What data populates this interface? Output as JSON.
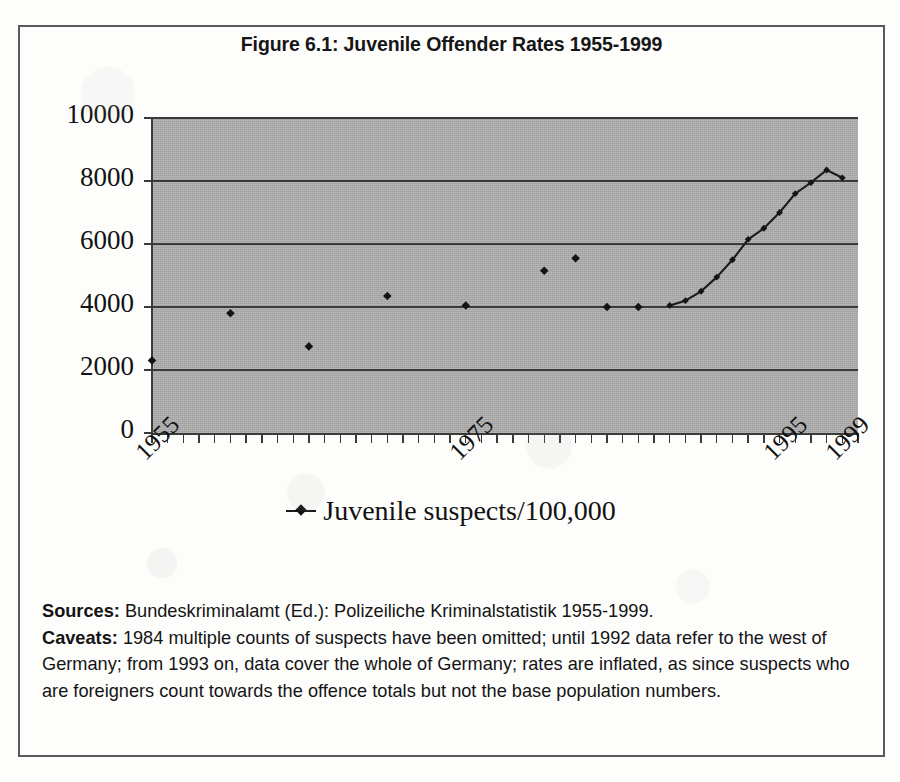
{
  "figure": {
    "title": "Figure 6.1: Juvenile Offender Rates 1955-1999",
    "legend_label": "Juvenile suspects/100,000",
    "legend_symbol": "line-with-diamond-marker",
    "sources_label": "Sources:",
    "sources_text": " Bundeskriminalamt (Ed.): Polizeiliche Kriminalstatistik 1955-1999.",
    "caveats_label": "Caveats:",
    "caveats_text": " 1984 multiple counts of suspects have been omitted; until 1992 data refer to the west of Germany; from 1993 on, data cover the whole of Germany; rates are inflated, as since suspects who are foreigners count towards the offence totals but not the base population numbers.",
    "colors": {
      "plot_background": "#a9a9a9",
      "gridline": "#3a3a3a",
      "series": "#1a1a1a",
      "frame": "#5a5a5a",
      "text": "#121212"
    }
  },
  "chart_data": {
    "type": "line",
    "title": "Figure 6.1: Juvenile Offender Rates 1955-1999",
    "xlabel": "",
    "ylabel": "",
    "ylim": [
      0,
      10000
    ],
    "xlim": [
      1955,
      2000
    ],
    "ytick_labels": [
      "10000",
      "8000",
      "6000",
      "4000",
      "2000",
      "0"
    ],
    "ytick_values": [
      10000,
      8000,
      6000,
      4000,
      2000,
      0
    ],
    "xtick_labels": [
      "1955",
      "1975",
      "1995",
      "1999"
    ],
    "xtick_values": [
      1955,
      1975,
      1995,
      1999
    ],
    "grid": "horizontal",
    "legend_position": "below-plot-center",
    "series": [
      {
        "name": "Juvenile suspects/100,000",
        "marker": "diamond",
        "note": "isolated markers for sparse early years; connected line from 1988 onwards",
        "points": [
          {
            "x": 1955,
            "y": 2300,
            "connected": false
          },
          {
            "x": 1960,
            "y": 3800,
            "connected": false
          },
          {
            "x": 1965,
            "y": 2750,
            "connected": false
          },
          {
            "x": 1970,
            "y": 4350,
            "connected": false
          },
          {
            "x": 1975,
            "y": 4050,
            "connected": false
          },
          {
            "x": 1980,
            "y": 5150,
            "connected": false
          },
          {
            "x": 1982,
            "y": 5550,
            "connected": false
          },
          {
            "x": 1984,
            "y": 4000,
            "connected": false
          },
          {
            "x": 1986,
            "y": 4000,
            "connected": false
          },
          {
            "x": 1988,
            "y": 4050,
            "connected": true
          },
          {
            "x": 1989,
            "y": 4200,
            "connected": true
          },
          {
            "x": 1990,
            "y": 4500,
            "connected": true
          },
          {
            "x": 1991,
            "y": 4950,
            "connected": true
          },
          {
            "x": 1992,
            "y": 5500,
            "connected": true
          },
          {
            "x": 1993,
            "y": 6150,
            "connected": true
          },
          {
            "x": 1994,
            "y": 6500,
            "connected": true
          },
          {
            "x": 1995,
            "y": 7000,
            "connected": true
          },
          {
            "x": 1996,
            "y": 7600,
            "connected": true
          },
          {
            "x": 1997,
            "y": 7950,
            "connected": true
          },
          {
            "x": 1998,
            "y": 8350,
            "connected": true
          },
          {
            "x": 1999,
            "y": 8100,
            "connected": true
          }
        ]
      }
    ]
  }
}
